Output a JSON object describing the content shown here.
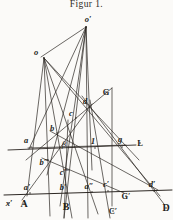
{
  "figure": {
    "title": "Figur 1.",
    "domain": "projective-geometry-line-figure",
    "canvas": {
      "width": 173,
      "height": 220
    },
    "ink_color": "#2b2622",
    "paper_color": "#fbfaf8"
  },
  "points": [
    {
      "id": "o-prime",
      "label": "o′",
      "x": 88,
      "y": 19,
      "px": 86,
      "py": 27,
      "style": "italic-bold"
    },
    {
      "id": "o",
      "label": "o",
      "x": 36,
      "y": 52,
      "px": 44,
      "py": 58,
      "style": "italic-bold"
    },
    {
      "id": "G",
      "label": "G",
      "x": 106,
      "y": 92,
      "px": 106,
      "py": 92,
      "style": "upright"
    },
    {
      "id": "d",
      "label": "d",
      "x": 85,
      "y": 101,
      "px": 89,
      "py": 107,
      "style": "italic-bold"
    },
    {
      "id": "c",
      "label": "c",
      "x": 71,
      "y": 113,
      "px": 76,
      "py": 118,
      "style": "italic-bold"
    },
    {
      "id": "b",
      "label": "b",
      "x": 52,
      "y": 128,
      "px": 57,
      "py": 133,
      "style": "italic-bold"
    },
    {
      "id": "beta",
      "label": "β",
      "x": 64,
      "y": 144,
      "px": 64,
      "py": 144,
      "style": "greek"
    },
    {
      "id": "a",
      "label": "a",
      "x": 26,
      "y": 140,
      "px": 31,
      "py": 147,
      "style": "italic-bold"
    },
    {
      "id": "one",
      "label": "1",
      "x": 93,
      "y": 141,
      "px": 95,
      "py": 148,
      "style": "num"
    },
    {
      "id": "g",
      "label": "g",
      "x": 120,
      "y": 139,
      "px": 122,
      "py": 147,
      "style": "italic-bold"
    },
    {
      "id": "L",
      "label": "L",
      "x": 140,
      "y": 143,
      "px": 140,
      "py": 143,
      "style": "upright"
    },
    {
      "id": "b-dblprime",
      "label": "b″",
      "x": 44,
      "y": 162,
      "px": 48,
      "py": 160,
      "style": "italic-bold"
    },
    {
      "id": "c-dblprime",
      "label": "c″",
      "x": 64,
      "y": 172,
      "px": 68,
      "py": 170,
      "style": "italic-bold"
    },
    {
      "id": "a-prime",
      "label": "a′",
      "x": 27,
      "y": 187,
      "px": 30,
      "py": 193,
      "style": "italic-bold"
    },
    {
      "id": "b-prime",
      "label": "b′",
      "x": 63,
      "y": 187,
      "px": 66,
      "py": 193,
      "style": "italic-bold"
    },
    {
      "id": "a-dblprime",
      "label": "a″",
      "x": 89,
      "y": 186,
      "px": 92,
      "py": 192,
      "style": "italic-bold"
    },
    {
      "id": "c-prime",
      "label": "c′",
      "x": 106,
      "y": 184,
      "px": 108,
      "py": 191,
      "style": "italic-bold"
    },
    {
      "id": "d-prime",
      "label": "d′",
      "x": 152,
      "y": 184,
      "px": 154,
      "py": 191,
      "style": "italic-bold"
    },
    {
      "id": "x-prime",
      "label": "x′",
      "x": 9,
      "y": 203,
      "px": 9,
      "py": 203,
      "style": "italic-bold"
    },
    {
      "id": "A",
      "label": "A",
      "x": 24,
      "y": 204,
      "px": 24,
      "py": 204,
      "style": "upright-big"
    },
    {
      "id": "B",
      "label": "B",
      "x": 66,
      "y": 207,
      "px": 66,
      "py": 207,
      "style": "upright-big"
    },
    {
      "id": "G-prime",
      "label": "G′",
      "x": 126,
      "y": 196,
      "px": 126,
      "py": 196,
      "style": "upright"
    },
    {
      "id": "C-prime",
      "label": "C′",
      "x": 113,
      "y": 211,
      "px": 113,
      "py": 211,
      "style": "upright"
    },
    {
      "id": "D",
      "label": "D",
      "x": 166,
      "y": 208,
      "px": 166,
      "py": 208,
      "style": "upright-big"
    }
  ],
  "lines": [
    {
      "id": "line-L",
      "name": "auxiliary-line-L",
      "x1": 8,
      "y1": 150,
      "x2": 136,
      "y2": 145,
      "weight": 0.9
    },
    {
      "id": "line-base",
      "name": "base-line-x-prime",
      "x1": 4,
      "y1": 195,
      "x2": 172,
      "y2": 190,
      "weight": 1.0
    },
    {
      "id": "o-to-a",
      "name": "ray-o-a",
      "x1": 44,
      "y1": 58,
      "x2": 27,
      "y2": 196,
      "weight": 0.7
    },
    {
      "id": "o-to-bpp",
      "name": "ray-o-b2",
      "x1": 44,
      "y1": 58,
      "x2": 50,
      "y2": 216,
      "weight": 0.7
    },
    {
      "id": "o-to-cpp",
      "name": "ray-o-c2",
      "x1": 44,
      "y1": 58,
      "x2": 72,
      "y2": 218,
      "weight": 0.7
    },
    {
      "id": "o-to-app",
      "name": "ray-o-a2",
      "x1": 44,
      "y1": 58,
      "x2": 98,
      "y2": 214,
      "weight": 0.7
    },
    {
      "id": "o-to-g",
      "name": "ray-o-g",
      "x1": 44,
      "y1": 58,
      "x2": 139,
      "y2": 160,
      "weight": 0.7
    },
    {
      "id": "o-to-dp",
      "name": "ray-o-dprime",
      "x1": 44,
      "y1": 58,
      "x2": 160,
      "y2": 196,
      "weight": 0.7
    },
    {
      "id": "op-to-o",
      "name": "ray-oprime-o",
      "x1": 86,
      "y1": 27,
      "x2": 41,
      "y2": 57,
      "weight": 0.7
    },
    {
      "id": "op-to-a",
      "name": "ray-oprime-a",
      "x1": 86,
      "y1": 27,
      "x2": 29,
      "y2": 149,
      "weight": 0.7
    },
    {
      "id": "op-to-b",
      "name": "ray-oprime-b",
      "x1": 86,
      "y1": 27,
      "x2": 47,
      "y2": 175,
      "weight": 0.7
    },
    {
      "id": "op-to-c",
      "name": "ray-oprime-c",
      "x1": 86,
      "y1": 27,
      "x2": 64,
      "y2": 218,
      "weight": 0.7
    },
    {
      "id": "op-to-one",
      "name": "ray-oprime-one",
      "x1": 86,
      "y1": 27,
      "x2": 88,
      "y2": 218,
      "weight": 0.7
    },
    {
      "id": "op-to-d",
      "name": "ray-oprime-d",
      "x1": 86,
      "y1": 27,
      "x2": 92,
      "y2": 170,
      "weight": 0.7
    },
    {
      "id": "op-to-bp",
      "name": "ray-oprime-bprime",
      "x1": 86,
      "y1": 27,
      "x2": 60,
      "y2": 206,
      "weight": 0.7
    },
    {
      "id": "pencil-G-left",
      "name": "ray-G-to-a",
      "x1": 112,
      "y1": 88,
      "x2": 26,
      "y2": 160,
      "weight": 0.7
    },
    {
      "id": "pencil-G-down",
      "name": "ray-G-to-Cprime",
      "x1": 112,
      "y1": 88,
      "x2": 112,
      "y2": 206,
      "weight": 0.7
    },
    {
      "id": "pencil-G-right",
      "name": "ray-G-to-D",
      "x1": 82,
      "y1": 96,
      "x2": 164,
      "y2": 204,
      "weight": 0.7
    },
    {
      "id": "chord-d-ap",
      "name": "chord-d-aprime",
      "x1": 92,
      "y1": 104,
      "x2": 22,
      "y2": 200,
      "weight": 0.7
    },
    {
      "id": "chord-b-dp",
      "name": "chord-b-dprime",
      "x1": 50,
      "y1": 131,
      "x2": 158,
      "y2": 190,
      "weight": 0.7
    },
    {
      "id": "chord-a-g",
      "name": "chord-a-g",
      "x1": 28,
      "y1": 148,
      "x2": 126,
      "y2": 145,
      "weight": 0.7
    },
    {
      "id": "chord-b2-Gp",
      "name": "chord-b2-Gprime",
      "x1": 42,
      "y1": 158,
      "x2": 124,
      "y2": 193,
      "weight": 0.7
    },
    {
      "id": "vert-B",
      "name": "vertical-B",
      "x1": 68,
      "y1": 120,
      "x2": 64,
      "y2": 218,
      "weight": 0.7
    },
    {
      "id": "vert-C",
      "name": "vertical-C",
      "x1": 90,
      "y1": 100,
      "x2": 110,
      "y2": 218,
      "weight": 0.7
    }
  ]
}
